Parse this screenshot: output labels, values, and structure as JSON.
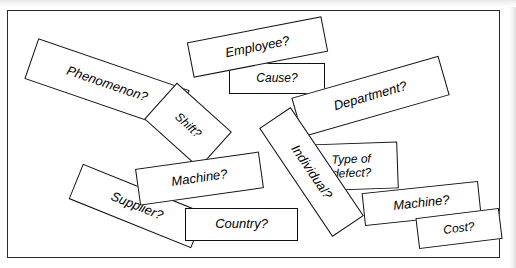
{
  "figure": {
    "kind": "scattered-cards-diagram",
    "frame": {
      "visible": true,
      "border_color": "#2a2a2a",
      "background_color": "#ffffff"
    },
    "card_style": {
      "fill": "#ffffff",
      "stroke": "#111111",
      "text_color": "#000000"
    }
  },
  "cards": [
    {
      "id": "phenomenon",
      "label": "Phenomenon?",
      "left": 26,
      "top": 62,
      "width": 160,
      "height": 43,
      "rotate": 19,
      "font_size": 13,
      "z": 3
    },
    {
      "id": "employee",
      "label": "Employee?",
      "left": 188,
      "top": 28,
      "width": 137,
      "height": 36,
      "rotate": -11,
      "font_size": 13,
      "z": 4
    },
    {
      "id": "cause",
      "label": "Cause?",
      "left": 228,
      "top": 62,
      "width": 96,
      "height": 31,
      "rotate": 0,
      "font_size": 12,
      "z": 3
    },
    {
      "id": "department",
      "label": "Department?",
      "left": 293,
      "top": 75,
      "width": 153,
      "height": 41,
      "rotate": -16,
      "font_size": 13,
      "z": 4
    },
    {
      "id": "shift",
      "label": "Shift?",
      "left": 150,
      "top": 100,
      "width": 74,
      "height": 49,
      "rotate": 42,
      "font_size": 12,
      "z": 5
    },
    {
      "id": "type-of-defect",
      "label": "Type of\ndefect?",
      "left": 304,
      "top": 142,
      "width": 93,
      "height": 47,
      "rotate": -2,
      "font_size": 12,
      "z": 6
    },
    {
      "id": "machine-left",
      "label": "Machine?",
      "left": 136,
      "top": 159,
      "width": 125,
      "height": 37,
      "rotate": -8,
      "font_size": 13,
      "z": 7
    },
    {
      "id": "individual",
      "label": "Individual?",
      "left": 245,
      "top": 152,
      "width": 131,
      "height": 38,
      "rotate": 56,
      "font_size": 13,
      "z": 9
    },
    {
      "id": "machine-right",
      "label": "Machine?",
      "left": 362,
      "top": 186,
      "width": 117,
      "height": 33,
      "rotate": -6,
      "font_size": 13,
      "z": 7
    },
    {
      "id": "supplier",
      "label": "Supplier?",
      "left": 70,
      "top": 186,
      "width": 132,
      "height": 38,
      "rotate": 22,
      "font_size": 13,
      "z": 6
    },
    {
      "id": "country",
      "label": "Country?",
      "left": 184,
      "top": 207,
      "width": 113,
      "height": 33,
      "rotate": 0,
      "font_size": 13,
      "z": 8
    },
    {
      "id": "cost",
      "label": "Cost?",
      "left": 416,
      "top": 212,
      "width": 84,
      "height": 31,
      "rotate": -7,
      "font_size": 12,
      "z": 8
    }
  ]
}
